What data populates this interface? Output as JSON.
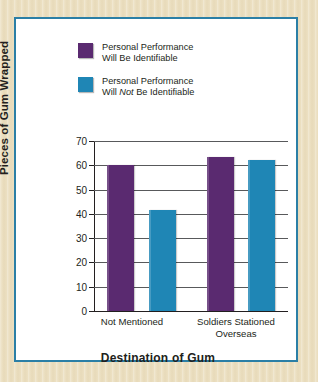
{
  "chart_data": {
    "type": "bar",
    "title": "",
    "xlabel": "Destination of Gum",
    "ylabel": "Pieces of Gum Wrapped",
    "categories": [
      "Not Mentioned",
      "Soldiers Stationed Overseas"
    ],
    "category_lines": [
      [
        "Not Mentioned"
      ],
      [
        "Soldiers Stationed",
        "Overseas"
      ]
    ],
    "series": [
      {
        "name": "Personal Performance Will Be Identifiable",
        "name_lines": [
          "Personal Performance",
          "Will Be Identifiable"
        ],
        "color": "#5a2a70",
        "values": [
          60,
          63.5
        ]
      },
      {
        "name": "Personal Performance Will Not Be Identifiable",
        "name_lines": [
          "Personal Performance",
          "Will Not Be Identifiable"
        ],
        "color": "#1f86b5",
        "values": [
          41.5,
          62
        ]
      }
    ],
    "ylim": [
      0,
      70
    ],
    "yticks": [
      0,
      10,
      20,
      30,
      40,
      50,
      60,
      70
    ],
    "ytick_labels": [
      "0",
      "10",
      "20",
      "30",
      "40",
      "50",
      "60",
      "70"
    ],
    "grid": true,
    "legend_position": "top-left-inside"
  },
  "legend": {
    "entries": [
      {
        "swatch": "purple",
        "line1": "Personal Performance",
        "line2_pre": "Will Be Identifiable",
        "line2_em": "",
        "line2_post": ""
      },
      {
        "swatch": "blue",
        "line1": "Personal Performance",
        "line2_pre": "Will ",
        "line2_em": "Not",
        "line2_post": " Be Identifiable"
      }
    ]
  },
  "colors": {
    "purple": "#5a2a70",
    "blue": "#1f86b5",
    "card_border": "#2b7fa6",
    "mat": "#ece0c2",
    "text": "#231f20",
    "gridline": "#58595b"
  }
}
